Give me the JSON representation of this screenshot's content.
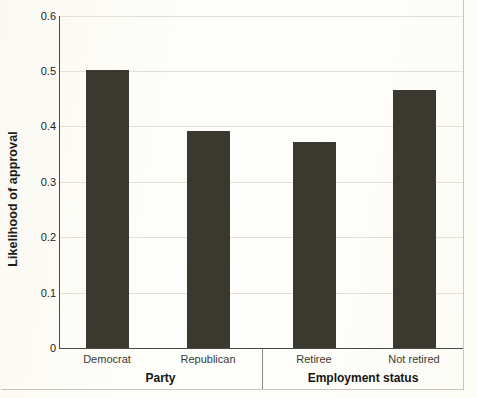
{
  "chart_data": {
    "type": "bar",
    "title": "",
    "xlabel": "",
    "ylabel": "Likelihood of approval",
    "ylim": [
      0,
      0.6
    ],
    "ytick_labels": [
      "0",
      "0.1",
      "0.2",
      "0.3",
      "0.4",
      "0.5",
      "0.6"
    ],
    "ytick_values": [
      0,
      0.1,
      0.2,
      0.3,
      0.4,
      0.5,
      0.6
    ],
    "grid": true,
    "legend": "none",
    "categories": [
      "Democrat",
      "Republican",
      "Retiree",
      "Not retired"
    ],
    "values": [
      0.503,
      0.393,
      0.373,
      0.466
    ],
    "groups": [
      {
        "label": "Party",
        "categories": [
          "Democrat",
          "Republican"
        ],
        "values": [
          0.503,
          0.393
        ]
      },
      {
        "label": "Employment status",
        "categories": [
          "Retiree",
          "Not retired"
        ],
        "values": [
          0.373,
          0.466
        ]
      }
    ],
    "bar_color": "#3a382f",
    "background_color": "#fdfdfa",
    "gridline_color": "#e2e0d7",
    "axis_color": "#4a4a46"
  }
}
